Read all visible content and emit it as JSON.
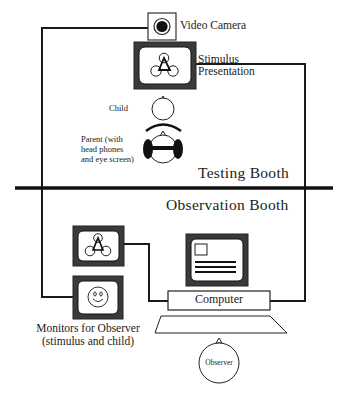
{
  "diagram": {
    "colors": {
      "line": "#1a1a1a",
      "monitor_frame": "#2b2b2b",
      "background": "#ffffff"
    },
    "testing_booth": {
      "label": "Testing Booth",
      "video_camera": {
        "label": "Video Camera",
        "icon": "camera-lens-icon"
      },
      "stimulus_presentation": {
        "label_line1": "Stimulus",
        "label_line2": "Presentation",
        "icon": "three-circles-triangle-icon"
      },
      "child": {
        "label": "Child"
      },
      "parent": {
        "label_line1": "Parent (with",
        "label_line2": "head phones",
        "label_line3": "and eye screen)"
      }
    },
    "observation_booth": {
      "label": "Observation Booth",
      "observer_monitors": {
        "label_line1": "Monitors for Observer",
        "label_line2": "(stimulus and child)",
        "monitors": [
          {
            "content": "stimulus",
            "icon": "three-circles-triangle-icon"
          },
          {
            "content": "child",
            "icon": "smiley-face-icon"
          }
        ]
      },
      "computer": {
        "label": "Computer"
      },
      "observer": {
        "label": "Observer"
      }
    }
  }
}
